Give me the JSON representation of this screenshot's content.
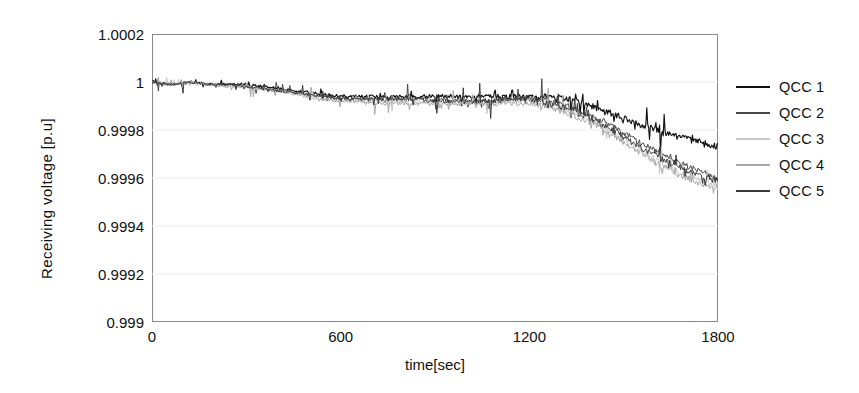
{
  "chart_data": {
    "type": "line",
    "title": "",
    "xlabel": "time[sec]",
    "ylabel": "Receiving voltage [p.u]",
    "xlim": [
      0,
      1800
    ],
    "ylim": [
      0.999,
      1.0002
    ],
    "grid": true,
    "legend_position": "right",
    "x_ticks": [
      "0",
      "600",
      "1200",
      "1800"
    ],
    "x_tick_values": [
      0,
      600,
      1200,
      1800
    ],
    "y_ticks": [
      "1.0002",
      "1",
      "0.9998",
      "0.9996",
      "0.9994",
      "0.9992",
      "0.999"
    ],
    "y_tick_values": [
      1.0002,
      1.0,
      0.9998,
      0.9996,
      0.9994,
      0.9992,
      0.999
    ],
    "x": [
      0,
      60,
      120,
      180,
      240,
      300,
      360,
      420,
      480,
      540,
      600,
      660,
      720,
      780,
      840,
      900,
      960,
      1020,
      1080,
      1140,
      1200,
      1260,
      1320,
      1380,
      1440,
      1500,
      1560,
      1620,
      1680,
      1740,
      1800
    ],
    "series": [
      {
        "name": "QCC 1",
        "color": "#111111",
        "values": [
          1.0,
          0.99999,
          1.0,
          0.99999,
          0.99999,
          0.99999,
          0.99998,
          0.99997,
          0.99996,
          0.99995,
          0.99994,
          0.99994,
          0.99994,
          0.99994,
          0.99994,
          0.99994,
          0.99994,
          0.99994,
          0.99994,
          0.99994,
          0.99994,
          0.99994,
          0.99993,
          0.99991,
          0.99988,
          0.99985,
          0.99982,
          0.99979,
          0.99977,
          0.99975,
          0.99973
        ]
      },
      {
        "name": "QCC 2",
        "color": "#4a4a4a",
        "values": [
          1.0,
          0.99999,
          1.0,
          0.99999,
          0.99999,
          0.99998,
          0.99997,
          0.99996,
          0.99995,
          0.99994,
          0.99993,
          0.99993,
          0.99993,
          0.99993,
          0.99993,
          0.99993,
          0.99992,
          0.99992,
          0.99992,
          0.99993,
          0.99993,
          0.99992,
          0.9999,
          0.99987,
          0.99983,
          0.99979,
          0.99974,
          0.9997,
          0.99966,
          0.99963,
          0.9996
        ]
      },
      {
        "name": "QCC 3",
        "color": "#c8c8c8",
        "values": [
          1.0,
          0.99999,
          1.0,
          0.99999,
          0.99998,
          0.99998,
          0.99997,
          0.99996,
          0.99995,
          0.99993,
          0.99992,
          0.99992,
          0.99992,
          0.99992,
          0.99992,
          0.99991,
          0.99991,
          0.99991,
          0.99991,
          0.99992,
          0.99992,
          0.9999,
          0.99988,
          0.99985,
          0.99981,
          0.99976,
          0.99971,
          0.99966,
          0.99962,
          0.99959,
          0.99957
        ]
      },
      {
        "name": "QCC 4",
        "color": "#a8a8a8",
        "values": [
          1.0,
          0.99999,
          1.0,
          0.99999,
          0.99998,
          0.99998,
          0.99997,
          0.99996,
          0.99994,
          0.99993,
          0.99992,
          0.99992,
          0.99991,
          0.99991,
          0.99991,
          0.99991,
          0.99991,
          0.99991,
          0.99991,
          0.99991,
          0.99991,
          0.9999,
          0.99987,
          0.99984,
          0.9998,
          0.99975,
          0.9997,
          0.99965,
          0.99961,
          0.99958,
          0.99956
        ]
      },
      {
        "name": "QCC 5",
        "color": "#3a3a3a",
        "values": [
          1.0,
          0.99999,
          1.0,
          0.99999,
          0.99999,
          0.99998,
          0.99997,
          0.99996,
          0.99995,
          0.99994,
          0.99993,
          0.99993,
          0.99993,
          0.99993,
          0.99993,
          0.99992,
          0.99992,
          0.99992,
          0.99992,
          0.99993,
          0.99993,
          0.99991,
          0.99989,
          0.99986,
          0.99982,
          0.99977,
          0.99972,
          0.99968,
          0.99964,
          0.99961,
          0.99959
        ]
      }
    ]
  },
  "legend": {
    "items": [
      {
        "label": "QCC 1"
      },
      {
        "label": "QCC 2"
      },
      {
        "label": "QCC 3"
      },
      {
        "label": "QCC 4"
      },
      {
        "label": "QCC 5"
      }
    ]
  }
}
